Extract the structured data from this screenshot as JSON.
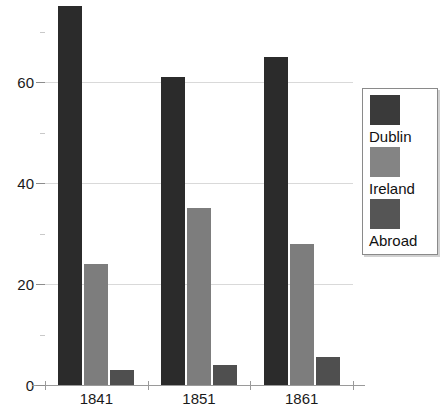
{
  "chart_data": {
    "type": "bar",
    "title": "",
    "xlabel": "",
    "ylabel": "",
    "categories": [
      "1841",
      "1851",
      "1861"
    ],
    "series": [
      {
        "name": "Dublin",
        "color": "#2b2b2b",
        "values": [
          75,
          61,
          65
        ]
      },
      {
        "name": "Ireland",
        "color": "#7d7d7d",
        "values": [
          24,
          35,
          28
        ]
      },
      {
        "name": "Abroad",
        "color": "#4f4f4f",
        "values": [
          3,
          4,
          5.5
        ]
      }
    ],
    "ylim": [
      0,
      76
    ],
    "yticks": [
      0,
      20,
      40,
      60
    ],
    "ytick_labels": [
      "0",
      "20",
      "40",
      "60"
    ],
    "yminor_ticks": [
      10,
      30,
      50,
      70
    ],
    "grid": true,
    "grid_axis": "y",
    "legend": {
      "position": "right",
      "entries": [
        {
          "label": "Dublin",
          "color": "#3a3a3a"
        },
        {
          "label": "Ireland",
          "color": "#848484"
        },
        {
          "label": "Abroad",
          "color": "#555555"
        }
      ]
    },
    "background": "#ffffff",
    "grid_color": "#d9d9d9",
    "axis_color": "#9a9a9a"
  }
}
